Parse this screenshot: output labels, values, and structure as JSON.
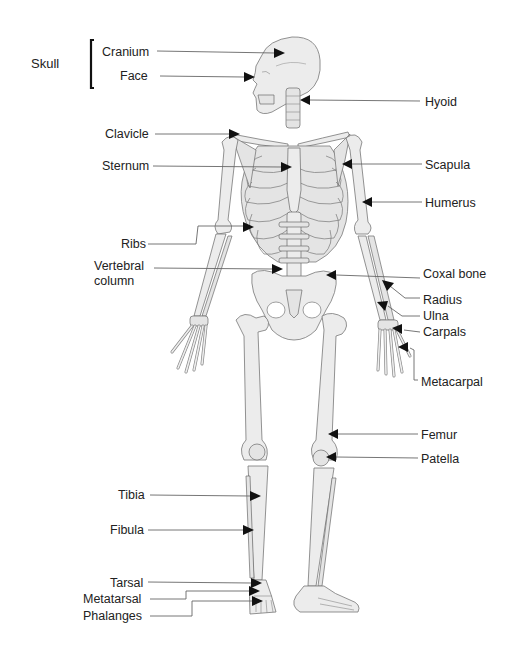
{
  "diagram": {
    "group_label": "Skull",
    "labels": {
      "cranium": "Cranium",
      "face": "Face",
      "hyoid": "Hyoid",
      "clavicle": "Clavicle",
      "sternum": "Sternum",
      "scapula": "Scapula",
      "humerus": "Humerus",
      "ribs": "Ribs",
      "vertebral_column_1": "Vertebral",
      "vertebral_column_2": "column",
      "coxal_bone": "Coxal bone",
      "radius": "Radius",
      "ulna": "Ulna",
      "carpals": "Carpals",
      "metacarpal": "Metacarpal",
      "femur": "Femur",
      "patella": "Patella",
      "tibia": "Tibia",
      "fibula": "Fibula",
      "tarsal": "Tarsal",
      "metatarsal": "Metatarsal",
      "phalanges": "Phalanges"
    },
    "colors": {
      "bone_fill": "#ececec",
      "outline": "#777777",
      "arrow": "#111111",
      "text": "#222222"
    }
  }
}
